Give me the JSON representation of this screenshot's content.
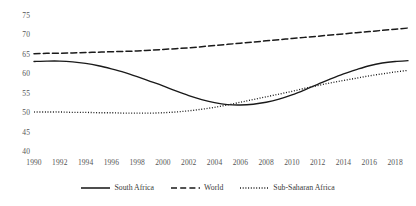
{
  "chart_data": {
    "type": "line",
    "title": "",
    "xlabel": "",
    "ylabel": "",
    "xlim": [
      1990,
      2019
    ],
    "ylim": [
      40,
      75
    ],
    "grid": false,
    "legend_position": "bottom",
    "x_tick_labels": [
      "1990",
      "1992",
      "1994",
      "1996",
      "1998",
      "2000",
      "2002",
      "2004",
      "2006",
      "2008",
      "2010",
      "2012",
      "2014",
      "2016",
      "2018"
    ],
    "y_tick_labels": [
      "40",
      "45",
      "50",
      "55",
      "60",
      "65",
      "70",
      "75"
    ],
    "y_ticks": [
      40,
      45,
      50,
      55,
      60,
      65,
      70,
      75
    ],
    "x": [
      1990,
      1991,
      1992,
      1993,
      1994,
      1995,
      1996,
      1997,
      1998,
      1999,
      2000,
      2001,
      2002,
      2003,
      2004,
      2005,
      2006,
      2007,
      2008,
      2009,
      2010,
      2011,
      2012,
      2013,
      2014,
      2015,
      2016,
      2017,
      2018,
      2019
    ],
    "series": [
      {
        "name": "South Africa",
        "style": "solid",
        "color": "#1a1a1a",
        "values": [
          63.3,
          63.4,
          63.4,
          63.2,
          62.8,
          62.2,
          61.4,
          60.5,
          59.4,
          58.2,
          57.0,
          55.7,
          54.5,
          53.5,
          52.7,
          52.2,
          52.1,
          52.3,
          52.8,
          53.6,
          54.7,
          56.0,
          57.4,
          58.8,
          60.1,
          61.2,
          62.2,
          62.9,
          63.3,
          63.5
        ]
      },
      {
        "name": "World",
        "style": "dashed",
        "color": "#1a1a1a",
        "values": [
          65.3,
          65.4,
          65.4,
          65.5,
          65.6,
          65.7,
          65.8,
          65.9,
          66.0,
          66.2,
          66.4,
          66.6,
          66.8,
          67.1,
          67.4,
          67.7,
          68.0,
          68.3,
          68.6,
          68.9,
          69.2,
          69.5,
          69.8,
          70.1,
          70.4,
          70.7,
          71.0,
          71.3,
          71.6,
          71.9
        ]
      },
      {
        "name": "Sub-Saharan Africa",
        "style": "dotted",
        "color": "#1a1a1a",
        "values": [
          50.3,
          50.3,
          50.3,
          50.2,
          50.2,
          50.1,
          50.1,
          50.0,
          50.0,
          50.0,
          50.1,
          50.3,
          50.6,
          51.0,
          51.5,
          52.1,
          52.8,
          53.5,
          54.2,
          54.9,
          55.6,
          56.4,
          57.1,
          57.8,
          58.4,
          59.0,
          59.6,
          60.1,
          60.6,
          61.0
        ]
      }
    ]
  },
  "legend": {
    "items": [
      {
        "label": "South Africa",
        "style": "solid"
      },
      {
        "label": "World",
        "style": "dashed"
      },
      {
        "label": "Sub-Saharan Africa",
        "style": "dotted"
      }
    ]
  }
}
